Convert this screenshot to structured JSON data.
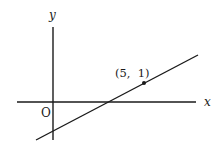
{
  "diagram": {
    "type": "coordinate-plane-line",
    "axes": {
      "x_label": "x",
      "y_label": "y",
      "origin_label": "O"
    },
    "line": {
      "description": "straight line with positive slope, negative y-intercept, positive x-intercept"
    },
    "point": {
      "label": "(5,  1)",
      "x": 5,
      "y": 1
    },
    "colors": {
      "ink": "#1a1a1a",
      "background": "#ffffff"
    }
  }
}
